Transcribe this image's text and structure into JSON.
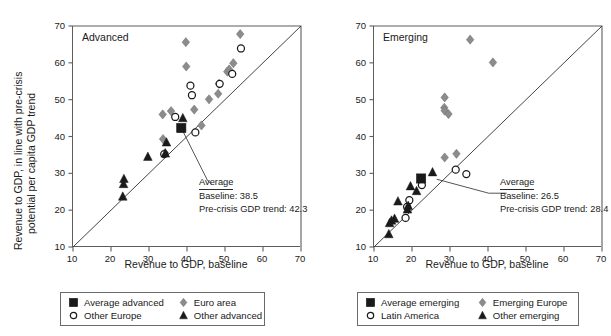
{
  "figure": {
    "background": "#ffffff",
    "marker_colors": {
      "square": "#1a1a1a",
      "diamond": "#8c8c8c",
      "circle_stroke": "#1a1a1a",
      "triangle": "#1a1a1a",
      "axis": "#5d5d5d",
      "reference_line": "#3a3a3a"
    }
  },
  "chart_data": [
    {
      "type": "scatter",
      "title": "Advanced",
      "xlabel": "Revenue to GDP, baseline",
      "ylabel": "Revenue to GDP, in line with pre-crisis potential per capita GDP trend",
      "xlim": [
        10,
        70
      ],
      "ylim": [
        10,
        70
      ],
      "xticks": [
        10,
        20,
        30,
        40,
        50,
        60,
        70
      ],
      "yticks": [
        10,
        20,
        30,
        40,
        50,
        60,
        70
      ],
      "grid": false,
      "reference_line": {
        "type": "45-degree identity",
        "from": [
          10,
          10
        ],
        "to": [
          70,
          70
        ]
      },
      "annotation": {
        "header": "Average",
        "lines": [
          "Baseline: 38.5",
          "Pre-crisis GDP trend: 42.3"
        ],
        "points_to": [
          38.5,
          42.3
        ]
      },
      "series": [
        {
          "name": "Average advanced",
          "marker": "square",
          "points": [
            [
              38.5,
              42.3
            ]
          ]
        },
        {
          "name": "Euro area",
          "marker": "diamond",
          "points": [
            [
              33.6,
              46.0
            ],
            [
              35.8,
              46.9
            ],
            [
              33.7,
              39.3
            ],
            [
              34.2,
              35.5
            ],
            [
              39.7,
              65.6
            ],
            [
              39.8,
              59.0
            ],
            [
              41.9,
              47.3
            ],
            [
              43.8,
              43.0
            ],
            [
              45.8,
              50.1
            ],
            [
              48.2,
              51.6
            ],
            [
              48.4,
              54.3
            ],
            [
              50.6,
              57.6
            ],
            [
              51.1,
              58.2
            ],
            [
              52.2,
              59.9
            ],
            [
              54.0,
              67.8
            ]
          ]
        },
        {
          "name": "Other Europe",
          "marker": "circle",
          "points": [
            [
              34.0,
              35.2
            ],
            [
              36.9,
              45.3
            ],
            [
              40.9,
              53.8
            ],
            [
              41.3,
              51.2
            ],
            [
              42.2,
              41.1
            ],
            [
              48.6,
              54.3
            ],
            [
              51.9,
              57.0
            ],
            [
              54.2,
              63.9
            ]
          ]
        },
        {
          "name": "Other advanced",
          "marker": "triangle",
          "points": [
            [
              23.1,
              23.7
            ],
            [
              23.3,
              27.1
            ],
            [
              23.4,
              28.5
            ],
            [
              29.7,
              34.5
            ],
            [
              34.3,
              35.4
            ],
            [
              34.6,
              38.4
            ],
            [
              38.9,
              45.0
            ]
          ]
        }
      ]
    },
    {
      "type": "scatter",
      "title": "Emerging",
      "xlabel": "Revenue to GDP, baseline",
      "ylabel": "",
      "xlim": [
        10,
        70
      ],
      "ylim": [
        10,
        70
      ],
      "xticks": [
        10,
        20,
        30,
        40,
        50,
        60,
        70
      ],
      "yticks": [
        10,
        20,
        30,
        40,
        50,
        60,
        70
      ],
      "grid": false,
      "reference_line": {
        "type": "45-degree identity",
        "from": [
          10,
          10
        ],
        "to": [
          70,
          70
        ]
      },
      "annotation": {
        "header": "Average",
        "lines": [
          "Baseline: 26.5",
          "Pre-crisis GDP trend: 28.4"
        ],
        "points_to": [
          26.5,
          28.4
        ]
      },
      "series": [
        {
          "name": "Average emerging",
          "marker": "square",
          "points": [
            [
              22.4,
              28.6
            ]
          ]
        },
        {
          "name": "Emerging Europe",
          "marker": "diamond",
          "points": [
            [
              28.6,
              50.6
            ],
            [
              28.5,
              47.8
            ],
            [
              28.6,
              47.0
            ],
            [
              29.6,
              46.1
            ],
            [
              28.6,
              34.3
            ],
            [
              31.7,
              35.3
            ],
            [
              35.3,
              66.3
            ],
            [
              41.3,
              60.1
            ]
          ]
        },
        {
          "name": "Latin America",
          "marker": "circle",
          "points": [
            [
              18.3,
              17.9
            ],
            [
              18.7,
              20.9
            ],
            [
              19.3,
              22.7
            ],
            [
              22.6,
              26.8
            ],
            [
              31.5,
              31.0
            ],
            [
              34.3,
              29.8
            ]
          ]
        },
        {
          "name": "Other emerging",
          "marker": "triangle",
          "points": [
            [
              13.9,
              13.5
            ],
            [
              14.1,
              16.5
            ],
            [
              14.6,
              17.2
            ],
            [
              15.4,
              17.7
            ],
            [
              16.3,
              22.4
            ],
            [
              18.8,
              20.2
            ],
            [
              19.0,
              21.2
            ],
            [
              19.6,
              26.5
            ],
            [
              21.2,
              25.2
            ],
            [
              25.4,
              30.3
            ]
          ]
        }
      ]
    }
  ],
  "panels": [
    {
      "id": "advanced",
      "tag": "Advanced",
      "axis_title_x": "Revenue to GDP, baseline",
      "axis_title_y": "Revenue to GDP, in line with pre-crisis\npotential per capita GDP trend",
      "axis_title_y_line1": "Revenue to GDP, in line with pre-crisis",
      "axis_title_y_line2": "potential per capita GDP trend",
      "annotation": {
        "header": "Average",
        "line1": "Baseline: 38.5",
        "line2": "Pre-crisis GDP trend: 42.3"
      },
      "legend": {
        "items": [
          {
            "label": "Average advanced",
            "marker": "square"
          },
          {
            "label": "Euro area",
            "marker": "diamond"
          },
          {
            "label": "Other Europe",
            "marker": "circle"
          },
          {
            "label": "Other advanced",
            "marker": "triangle"
          }
        ]
      }
    },
    {
      "id": "emerging",
      "tag": "Emerging",
      "axis_title_x": "Revenue to GDP, baseline",
      "axis_title_y": "",
      "annotation": {
        "header": "Average",
        "line1": "Baseline: 26.5",
        "line2": "Pre-crisis GDP trend: 28.4"
      },
      "legend": {
        "items": [
          {
            "label": "Average emerging",
            "marker": "square"
          },
          {
            "label": "Emerging Europe",
            "marker": "diamond"
          },
          {
            "label": "Latin America",
            "marker": "circle"
          },
          {
            "label": "Other emerging",
            "marker": "triangle"
          }
        ]
      }
    }
  ]
}
